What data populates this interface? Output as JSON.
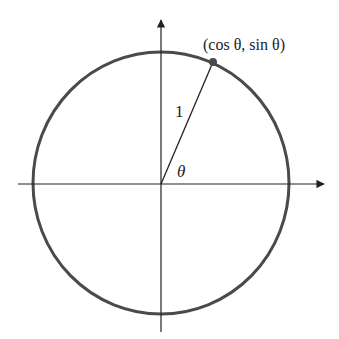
{
  "diagram": {
    "point_label": "(cos θ, sin θ)",
    "radius_label": "1",
    "angle_label": "θ",
    "colors": {
      "circle": "#4a4a4a",
      "axes": "#222222",
      "point": "#4a4a4a",
      "background": "#ffffff"
    }
  }
}
